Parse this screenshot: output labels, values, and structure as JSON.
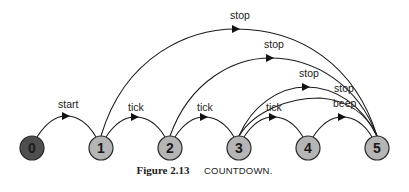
{
  "diagram": {
    "type": "state-machine",
    "nodes": [
      {
        "id": "0",
        "label": "0",
        "fill": "#4f4f4f",
        "x": 32
      },
      {
        "id": "1",
        "label": "1",
        "fill": "#b5b5b5",
        "x": 101
      },
      {
        "id": "2",
        "label": "2",
        "fill": "#b5b5b5",
        "x": 170
      },
      {
        "id": "3",
        "label": "3",
        "fill": "#b5b5b5",
        "x": 239
      },
      {
        "id": "4",
        "label": "4",
        "fill": "#b5b5b5",
        "x": 308
      },
      {
        "id": "5",
        "label": "5",
        "fill": "#b5b5b5",
        "x": 377
      }
    ],
    "edges": [
      {
        "from": "0",
        "to": "1",
        "label": "start"
      },
      {
        "from": "1",
        "to": "2",
        "label": "tick"
      },
      {
        "from": "2",
        "to": "3",
        "label": "tick"
      },
      {
        "from": "3",
        "to": "4",
        "label": "tick"
      },
      {
        "from": "4",
        "to": "5",
        "label": "beep"
      },
      {
        "from": "1",
        "to": "5",
        "label": "stop"
      },
      {
        "from": "2",
        "to": "5",
        "label": "stop"
      },
      {
        "from": "3",
        "to": "5",
        "label": "stop"
      },
      {
        "from": "4",
        "to": "5",
        "label": "stop"
      }
    ]
  },
  "caption": {
    "figure_number": "Figure 2.13",
    "title": "COUNTDOWN."
  }
}
